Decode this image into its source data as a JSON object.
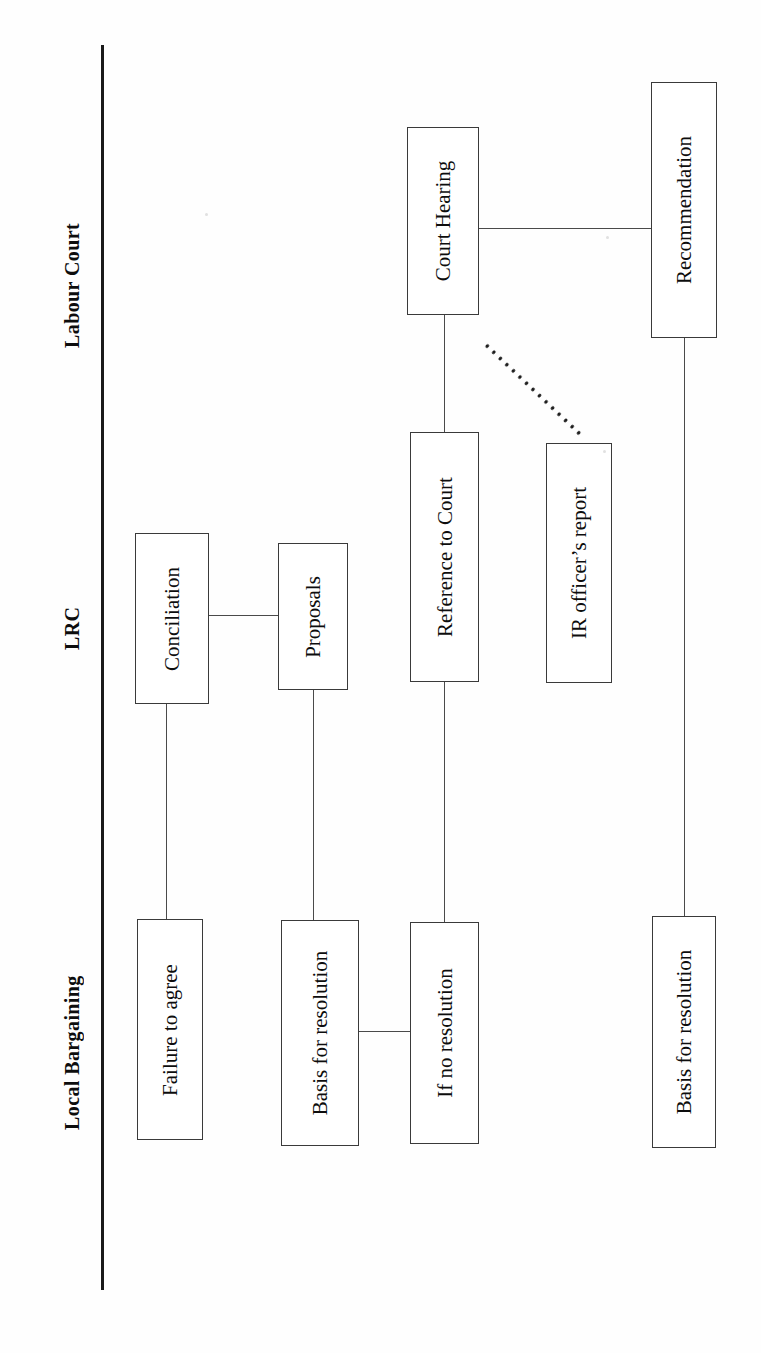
{
  "diagram": {
    "orientation": "rotated-90-ccw",
    "line_color": "#3a3a3a",
    "text_color": "#0d0d0d",
    "rule_color": "#1a1a1a",
    "columns": [
      {
        "id": "labour-court",
        "label": "Labour Court"
      },
      {
        "id": "lrc",
        "label": "LRC"
      },
      {
        "id": "local-bargaining",
        "label": "Local Bargaining"
      }
    ],
    "nodes": [
      {
        "id": "court-hearing",
        "label": "Court Hearing",
        "column": "labour-court"
      },
      {
        "id": "recommendation",
        "label": "Recommendation",
        "column": "labour-court"
      },
      {
        "id": "reference-to-court",
        "label": "Reference to Court",
        "column": "labour-court"
      },
      {
        "id": "ir-officers-report",
        "label": "IR officer’s report",
        "column": "labour-court"
      },
      {
        "id": "conciliation",
        "label": "Conciliation",
        "column": "lrc"
      },
      {
        "id": "proposals",
        "label": "Proposals",
        "column": "lrc"
      },
      {
        "id": "failure-to-agree",
        "label": "Failure to agree",
        "column": "local-bargaining"
      },
      {
        "id": "basis-for-resolution-1",
        "label": "Basis for resolution",
        "column": "local-bargaining"
      },
      {
        "id": "if-no-resolution",
        "label": "If no resolution",
        "column": "local-bargaining"
      },
      {
        "id": "basis-for-resolution-2",
        "label": "Basis for resolution",
        "column": "local-bargaining"
      }
    ],
    "connections": [
      {
        "id": "conciliation-to-proposals",
        "from": "conciliation",
        "to": "proposals",
        "style": "solid"
      },
      {
        "id": "conciliation-to-failure",
        "from": "conciliation",
        "to": "failure-to-agree",
        "style": "solid"
      },
      {
        "id": "proposals-to-basis1",
        "from": "proposals",
        "to": "basis-for-resolution-1",
        "style": "solid"
      },
      {
        "id": "basis1-to-if-no-resolution",
        "from": "basis-for-resolution-1",
        "to": "if-no-resolution",
        "style": "solid"
      },
      {
        "id": "if-no-resolution-to-reference",
        "from": "if-no-resolution",
        "to": "reference-to-court",
        "style": "solid"
      },
      {
        "id": "reference-to-court-hearing",
        "from": "reference-to-court",
        "to": "court-hearing",
        "style": "solid"
      },
      {
        "id": "court-hearing-to-recommendation",
        "from": "court-hearing",
        "to": "recommendation",
        "style": "solid"
      },
      {
        "id": "court-hearing-to-ir-report",
        "from": "court-hearing",
        "to": "ir-officers-report",
        "style": "dotted"
      },
      {
        "id": "recommendation-to-basis2",
        "from": "recommendation",
        "to": "basis-for-resolution-2",
        "style": "solid"
      }
    ]
  }
}
